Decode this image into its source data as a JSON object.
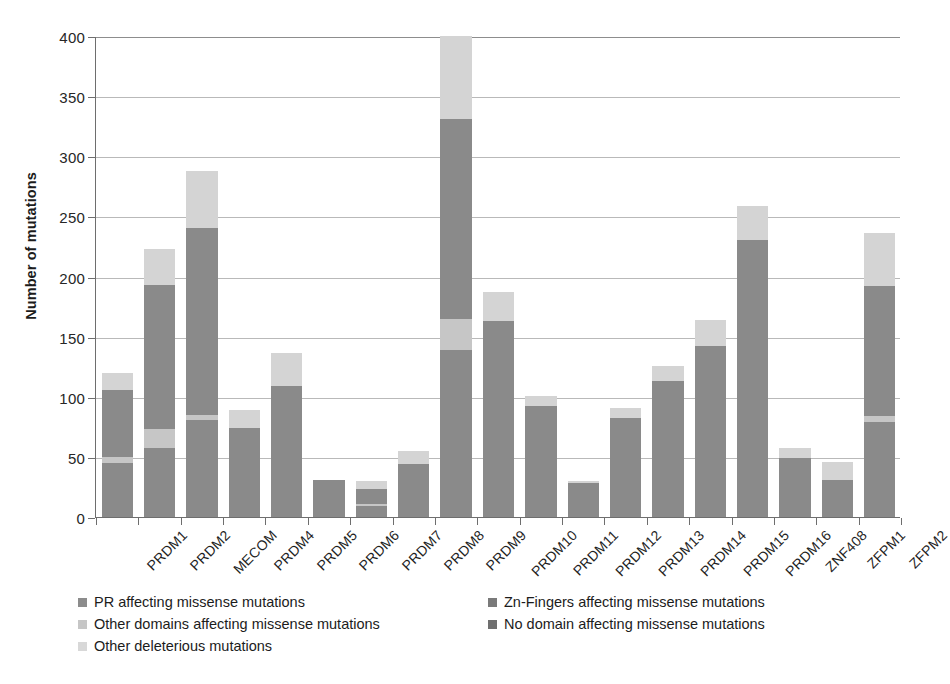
{
  "chart_data": {
    "type": "bar",
    "subtype": "stacked-bar",
    "title": "",
    "xlabel": "",
    "ylabel": "Number of mutations",
    "ylim": [
      0,
      400
    ],
    "yticks": [
      0,
      50,
      100,
      150,
      200,
      250,
      300,
      350,
      400
    ],
    "grid": true,
    "legend_position": "bottom",
    "categories": [
      "PRDM1",
      "PRDM2",
      "MECOM",
      "PRDM4",
      "PRDM5",
      "PRDM6",
      "PRDM7",
      "PRDM8",
      "PRDM9",
      "PRDM10",
      "PRDM11",
      "PRDM12",
      "PRDM13",
      "PRDM14",
      "PRDM15",
      "PRDM16",
      "ZNF408",
      "ZFPM1",
      "ZFPM2"
    ],
    "series": [
      {
        "name": "PR affecting missense mutations",
        "color": "#8c8c8c",
        "values": [
          0,
          0,
          0,
          0,
          0,
          0,
          0,
          0,
          0,
          0,
          0,
          0,
          0,
          0,
          0,
          0,
          0,
          0,
          0
        ]
      },
      {
        "name": "Zn-Fingers affecting missense mutations",
        "color": "#7a7a7a",
        "values": [
          0,
          0,
          0,
          0,
          0,
          0,
          0,
          0,
          0,
          0,
          0,
          0,
          0,
          0,
          0,
          0,
          0,
          0,
          0
        ]
      },
      {
        "name": "Other domains affecting missense mutations",
        "color": "#c6c6c6",
        "values": [
          5,
          16,
          4,
          0,
          0,
          0,
          2,
          0,
          26,
          0,
          0,
          0,
          0,
          0,
          0,
          0,
          0,
          0,
          5
        ]
      },
      {
        "name": "No domain affecting missense mutations",
        "color": "#8a8a8a",
        "values": [
          101,
          177,
          236,
          74,
          109,
          31,
          21,
          44,
          305,
          163,
          92,
          28,
          82,
          113,
          142,
          230,
          49,
          31,
          187
        ]
      },
      {
        "name": "Other deleterious mutations",
        "color": "#d4d4d4",
        "values": [
          14,
          30,
          48,
          15,
          27,
          0,
          7,
          11,
          69,
          24,
          9,
          2,
          9,
          13,
          22,
          29,
          8,
          15,
          44
        ]
      }
    ],
    "totals": [
      120,
      223,
      288,
      89,
      136,
      31,
      30,
      55,
      400,
      187,
      101,
      30,
      91,
      126,
      164,
      259,
      57,
      46,
      236
    ],
    "stack_breakdown": [
      {
        "category": "PRDM1",
        "segments": [
          {
            "series": "No domain affecting missense mutations",
            "from": 0,
            "to": 45
          },
          {
            "series": "Other domains affecting missense mutations",
            "from": 45,
            "to": 50
          },
          {
            "series": "No domain affecting missense mutations",
            "from": 50,
            "to": 106
          },
          {
            "series": "Other deleterious mutations",
            "from": 106,
            "to": 120
          }
        ]
      },
      {
        "category": "PRDM2",
        "segments": [
          {
            "series": "No domain affecting missense mutations",
            "from": 0,
            "to": 57
          },
          {
            "series": "Other domains affecting missense mutations",
            "from": 57,
            "to": 73
          },
          {
            "series": "No domain affecting missense mutations",
            "from": 73,
            "to": 193
          },
          {
            "series": "Other deleterious mutations",
            "from": 193,
            "to": 223
          }
        ]
      },
      {
        "category": "MECOM",
        "segments": [
          {
            "series": "No domain affecting missense mutations",
            "from": 0,
            "to": 81
          },
          {
            "series": "Other domains affecting missense mutations",
            "from": 81,
            "to": 85
          },
          {
            "series": "No domain affecting missense mutations",
            "from": 85,
            "to": 240
          },
          {
            "series": "Other deleterious mutations",
            "from": 240,
            "to": 288
          }
        ]
      },
      {
        "category": "PRDM4",
        "segments": [
          {
            "series": "No domain affecting missense mutations",
            "from": 0,
            "to": 74
          },
          {
            "series": "Other deleterious mutations",
            "from": 74,
            "to": 89
          }
        ]
      },
      {
        "category": "PRDM5",
        "segments": [
          {
            "series": "No domain affecting missense mutations",
            "from": 0,
            "to": 109
          },
          {
            "series": "Other deleterious mutations",
            "from": 109,
            "to": 136
          }
        ]
      },
      {
        "category": "PRDM6",
        "segments": [
          {
            "series": "No domain affecting missense mutations",
            "from": 0,
            "to": 31
          }
        ]
      },
      {
        "category": "PRDM7",
        "segments": [
          {
            "series": "No domain affecting missense mutations",
            "from": 0,
            "to": 9
          },
          {
            "series": "Other domains affecting missense mutations",
            "from": 9,
            "to": 11
          },
          {
            "series": "No domain affecting missense mutations",
            "from": 11,
            "to": 23
          },
          {
            "series": "Other deleterious mutations",
            "from": 23,
            "to": 30
          }
        ]
      },
      {
        "category": "PRDM8",
        "segments": [
          {
            "series": "No domain affecting missense mutations",
            "from": 0,
            "to": 44
          },
          {
            "series": "Other deleterious mutations",
            "from": 44,
            "to": 55
          }
        ]
      },
      {
        "category": "PRDM9",
        "segments": [
          {
            "series": "No domain affecting missense mutations",
            "from": 0,
            "to": 139
          },
          {
            "series": "Other domains affecting missense mutations",
            "from": 139,
            "to": 165
          },
          {
            "series": "No domain affecting missense mutations",
            "from": 165,
            "to": 331
          },
          {
            "series": "Other deleterious mutations",
            "from": 331,
            "to": 400
          }
        ]
      },
      {
        "category": "PRDM10",
        "segments": [
          {
            "series": "No domain affecting missense mutations",
            "from": 0,
            "to": 163
          },
          {
            "series": "Other deleterious mutations",
            "from": 163,
            "to": 187
          }
        ]
      },
      {
        "category": "PRDM11",
        "segments": [
          {
            "series": "No domain affecting missense mutations",
            "from": 0,
            "to": 92
          },
          {
            "series": "Other deleterious mutations",
            "from": 92,
            "to": 101
          }
        ]
      },
      {
        "category": "PRDM12",
        "segments": [
          {
            "series": "No domain affecting missense mutations",
            "from": 0,
            "to": 28
          },
          {
            "series": "Other deleterious mutations",
            "from": 28,
            "to": 30
          }
        ]
      },
      {
        "category": "PRDM13",
        "segments": [
          {
            "series": "No domain affecting missense mutations",
            "from": 0,
            "to": 82
          },
          {
            "series": "Other deleterious mutations",
            "from": 82,
            "to": 91
          }
        ]
      },
      {
        "category": "PRDM14",
        "segments": [
          {
            "series": "No domain affecting missense mutations",
            "from": 0,
            "to": 113
          },
          {
            "series": "Other deleterious mutations",
            "from": 113,
            "to": 126
          }
        ]
      },
      {
        "category": "PRDM15",
        "segments": [
          {
            "series": "No domain affecting missense mutations",
            "from": 0,
            "to": 142
          },
          {
            "series": "Other deleterious mutations",
            "from": 142,
            "to": 164
          }
        ]
      },
      {
        "category": "PRDM16",
        "segments": [
          {
            "series": "No domain affecting missense mutations",
            "from": 0,
            "to": 230
          },
          {
            "series": "Other deleterious mutations",
            "from": 230,
            "to": 259
          }
        ]
      },
      {
        "category": "ZNF408",
        "segments": [
          {
            "series": "No domain affecting missense mutations",
            "from": 0,
            "to": 49
          },
          {
            "series": "Other deleterious mutations",
            "from": 49,
            "to": 57
          }
        ]
      },
      {
        "category": "ZFPM1",
        "segments": [
          {
            "series": "No domain affecting missense mutations",
            "from": 0,
            "to": 31
          },
          {
            "series": "Other deleterious mutations",
            "from": 31,
            "to": 46
          }
        ]
      },
      {
        "category": "ZFPM2",
        "segments": [
          {
            "series": "No domain affecting missense mutations",
            "from": 0,
            "to": 79
          },
          {
            "series": "Other domains affecting missense mutations",
            "from": 79,
            "to": 84
          },
          {
            "series": "No domain affecting missense mutations",
            "from": 84,
            "to": 192
          },
          {
            "series": "Other deleterious mutations",
            "from": 192,
            "to": 236
          }
        ]
      }
    ]
  },
  "legend": {
    "items": [
      {
        "label": "PR affecting missense mutations",
        "color": "#8c8c8c",
        "col": 0,
        "row": 0
      },
      {
        "label": "Other domains affecting missense mutations",
        "color": "#c6c6c6",
        "col": 0,
        "row": 1
      },
      {
        "label": "Other deleterious mutations",
        "color": "#d8d8d8",
        "col": 0,
        "row": 2
      },
      {
        "label": "Zn-Fingers affecting missense mutations",
        "color": "#7a7a7a",
        "col": 1,
        "row": 0
      },
      {
        "label": "No domain affecting missense mutations",
        "color": "#6f6f6f",
        "col": 1,
        "row": 1
      }
    ]
  },
  "axis": {
    "y_title": "Number of mutations"
  }
}
